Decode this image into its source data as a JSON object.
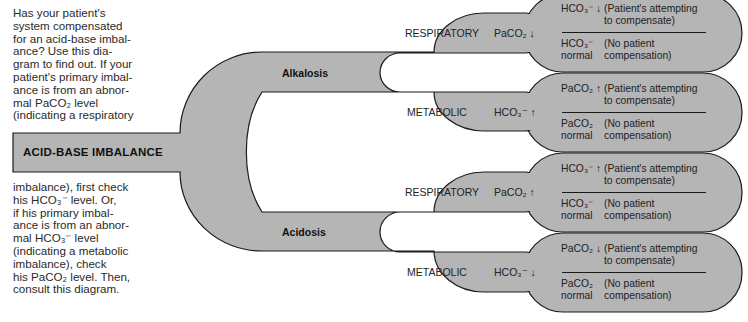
{
  "intro": {
    "top_text": "Has your patient's system compensated for an acid-base imbalance? Use this diagram to find out. If your patient's primary imbalance is from an abnormal PaCO₂ level (indicating a respiratory",
    "top_lines": [
      "Has your patient's",
      "system compensated",
      "for an acid-base imbal-",
      "ance? Use this dia-",
      "gram to find out. If your",
      "patient's primary imbal-",
      "ance is from an abnor-",
      "mal PaCO₂ level",
      "(indicating a respiratory"
    ],
    "bottom_lines": [
      "imbalance), first check",
      "his HCO₃⁻ level. Or,",
      "if his primary imbal-",
      "ance is from an abnor-",
      "mal HCO₃⁻ level",
      "(indicating a metabolic",
      "imbalance), check",
      "his PaCO₂ level. Then,",
      "consult this diagram."
    ]
  },
  "diagram": {
    "root": "ACID-BASE IMBALANCE",
    "fill_color": "#b5b5b5",
    "stroke_color": "#1a1a1a",
    "branches": [
      {
        "label": "Alkalosis",
        "types": [
          {
            "label": "RESPIRATORY",
            "primary": "PaCO₂ ↓",
            "outcomes": [
              {
                "value": "HCO₃⁻ ↓",
                "value_line2": "",
                "note_line1": "(Patient's attempting",
                "note_line2": "to compensate)"
              },
              {
                "value": "HCO₃⁻",
                "value_line2": "normal",
                "note_line1": "(No patient",
                "note_line2": "compensation)"
              }
            ]
          },
          {
            "label": "METABOLIC",
            "primary": "HCO₃⁻ ↑",
            "outcomes": [
              {
                "value": "PaCO₂ ↑",
                "value_line2": "",
                "note_line1": "(Patient's attempting",
                "note_line2": "to compensate)"
              },
              {
                "value": "PaCO₂",
                "value_line2": "normal",
                "note_line1": "(No patient",
                "note_line2": "compensation)"
              }
            ]
          }
        ]
      },
      {
        "label": "Acidosis",
        "types": [
          {
            "label": "RESPIRATORY",
            "primary": "PaCO₂ ↑",
            "outcomes": [
              {
                "value": "HCO₃⁻ ↑",
                "value_line2": "",
                "note_line1": "(Patient's attempting",
                "note_line2": "to compensate)"
              },
              {
                "value": "HCO₃⁻",
                "value_line2": "normal",
                "note_line1": "(No patient",
                "note_line2": "compensation)"
              }
            ]
          },
          {
            "label": "METABOLIC",
            "primary": "HCO₃⁻ ↓",
            "outcomes": [
              {
                "value": "PaCO₂ ↓",
                "value_line2": "",
                "note_line1": "(Patient's attempting",
                "note_line2": "to compensate)"
              },
              {
                "value": "PaCO₂",
                "value_line2": "normal",
                "note_line1": "(No patient",
                "note_line2": "compensation)"
              }
            ]
          }
        ]
      }
    ]
  }
}
